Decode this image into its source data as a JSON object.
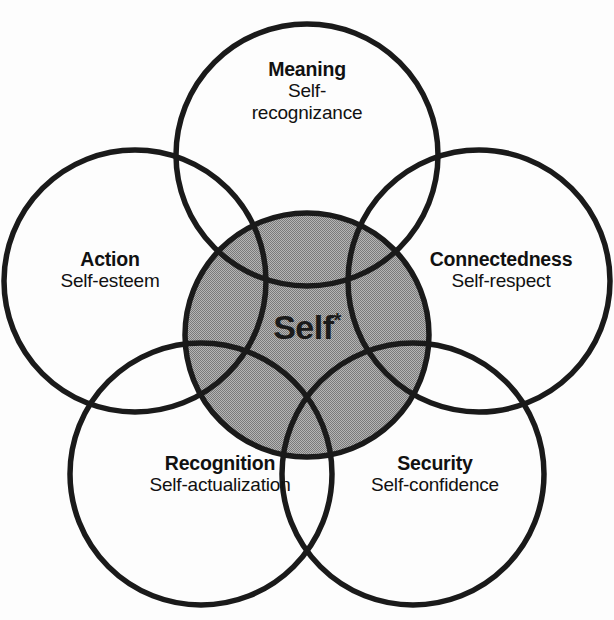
{
  "diagram": {
    "background_color": "#fdfdfd",
    "stroke_color": "#1a1a1a",
    "center_fill_color": "#9e9e9e",
    "center": {
      "label": "Self",
      "superscript": "*"
    },
    "petals": [
      {
        "id": "meaning",
        "title": "Meaning",
        "subtitle_line1": "Self-",
        "subtitle_line2": "recognizance",
        "subtitle": "Self-recognizance",
        "position": "top"
      },
      {
        "id": "connectedness",
        "title": "Connectedness",
        "subtitle": "Self-respect",
        "position": "right"
      },
      {
        "id": "security",
        "title": "Security",
        "subtitle": "Self-confidence",
        "position": "bottom-right"
      },
      {
        "id": "recognition",
        "title": "Recognition",
        "subtitle": "Self-actualization",
        "position": "bottom-left"
      },
      {
        "id": "action",
        "title": "Action",
        "subtitle": "Self-esteem",
        "position": "left"
      }
    ],
    "geometry": {
      "canvas_width": 614,
      "canvas_height": 620,
      "center_circle": {
        "cx": 307,
        "cy": 335,
        "r": 122
      },
      "petal_radius": 131,
      "petal_orbit_radius": 181,
      "petal_centers": [
        {
          "id": "meaning",
          "cx": 307,
          "cy": 155
        },
        {
          "id": "connectedness",
          "cx": 479,
          "cy": 281
        },
        {
          "id": "security",
          "cx": 413,
          "cy": 474
        },
        {
          "id": "recognition",
          "cx": 201,
          "cy": 474
        },
        {
          "id": "action",
          "cx": 135,
          "cy": 281
        }
      ]
    }
  }
}
